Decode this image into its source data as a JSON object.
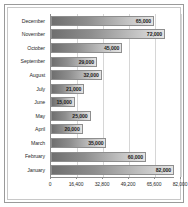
{
  "chart_data": {
    "type": "bar",
    "orientation": "horizontal",
    "title": "",
    "xlabel": "",
    "ylabel": "",
    "xlim": [
      0,
      82000
    ],
    "grid": true,
    "legend": false,
    "xticks": [
      "0",
      "16,400",
      "32,800",
      "49,200",
      "65,600",
      "82,000"
    ],
    "xtick_values": [
      0,
      16400,
      32800,
      49200,
      65600,
      82000
    ],
    "categories": [
      "December",
      "November",
      "October",
      "September",
      "August",
      "July",
      "June",
      "May",
      "April",
      "March",
      "February",
      "January"
    ],
    "values": [
      65000,
      72000,
      45000,
      29000,
      32000,
      21000,
      15000,
      25000,
      20000,
      35000,
      60000,
      82000
    ],
    "value_labels": [
      "65,000",
      "72,000",
      "45,000",
      "29,000",
      "32,000",
      "21,000",
      "15,000",
      "25,000",
      "20,000",
      "35,000",
      "60,000",
      "82,000"
    ]
  },
  "style": {
    "bar_fill_dark": "#6f6f6f",
    "bar_fill_light": "#e4e4e4",
    "bar_border": "#8e8e8e",
    "gridline_color": "#d6d6d6",
    "axis_color": "#8d8d8d",
    "frame_color": "#9a9a9a",
    "plot_background": "#ffffff",
    "text_color": "#2a2a2a"
  }
}
